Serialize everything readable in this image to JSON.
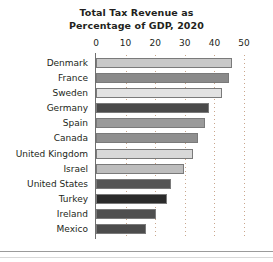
{
  "chart_data": {
    "type": "bar",
    "orientation": "horizontal",
    "title": "Total Tax Revenue as Percentage of GDP, 2020",
    "title_lines": [
      "Total Tax Revenue as",
      "Percentage of GDP, 2020"
    ],
    "xlabel": "",
    "ylabel": "",
    "xlim": [
      0,
      50
    ],
    "xticks": [
      0,
      10,
      20,
      30,
      40,
      50
    ],
    "xtick_labels": [
      "0",
      "10",
      "20",
      "30",
      "40",
      "50"
    ],
    "grid": true,
    "grid_axis": "x",
    "grid_style": "dotted",
    "grid_color": "#c9a68c",
    "legend": false,
    "categories": [
      "Denmark",
      "France",
      "Sweden",
      "Germany",
      "Spain",
      "Canada",
      "United Kingdom",
      "Israel",
      "United States",
      "Turkey",
      "Ireland",
      "Mexico"
    ],
    "values": [
      46.0,
      45.0,
      42.6,
      38.3,
      36.8,
      34.4,
      32.8,
      29.7,
      25.5,
      23.9,
      20.2,
      17.0
    ],
    "bar_colors": [
      "#c8c8c8",
      "#8a8a8a",
      "#e2e2e2",
      "#4a4a4a",
      "#9a9a9a",
      "#8f8f8f",
      "#d8d8d8",
      "#bdbdbd",
      "#555555",
      "#2b2b2b",
      "#4f4f4f",
      "#4c4c4c"
    ],
    "bars": [
      {
        "label": "Denmark",
        "value": 46.0,
        "color": "#c8c8c8"
      },
      {
        "label": "France",
        "value": 45.0,
        "color": "#8a8a8a"
      },
      {
        "label": "Sweden",
        "value": 42.6,
        "color": "#e2e2e2"
      },
      {
        "label": "Germany",
        "value": 38.3,
        "color": "#4a4a4a"
      },
      {
        "label": "Spain",
        "value": 36.8,
        "color": "#9a9a9a"
      },
      {
        "label": "Canada",
        "value": 34.4,
        "color": "#8f8f8f"
      },
      {
        "label": "United Kingdom",
        "value": 32.8,
        "color": "#d8d8d8"
      },
      {
        "label": "Israel",
        "value": 29.7,
        "color": "#bdbdbd"
      },
      {
        "label": "United States",
        "value": 25.5,
        "color": "#555555"
      },
      {
        "label": "Turkey",
        "value": 23.9,
        "color": "#2b2b2b"
      },
      {
        "label": "Ireland",
        "value": 20.2,
        "color": "#4f4f4f"
      },
      {
        "label": "Mexico",
        "value": 17.0,
        "color": "#4c4c4c"
      }
    ]
  }
}
